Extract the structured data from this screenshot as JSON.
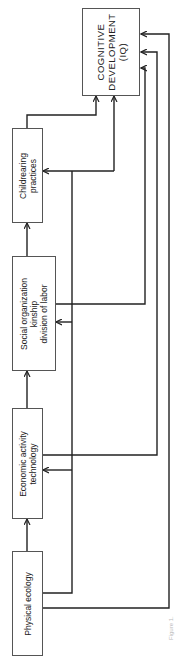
{
  "diagram": {
    "type": "flow-diagram",
    "orientation": "rotated-90-ccw",
    "nodes": [
      {
        "id": "physical_ecology",
        "lines": [
          "Physical ecology"
        ]
      },
      {
        "id": "economic_activity",
        "lines": [
          "Economic activity",
          "technology"
        ]
      },
      {
        "id": "social_organization",
        "lines": [
          "Social organization",
          "kinship",
          "division of labor"
        ]
      },
      {
        "id": "childrearing",
        "lines": [
          "Childrearing",
          "practices"
        ]
      },
      {
        "id": "cognitive_development",
        "lines": [
          "COGNITIVE",
          "DEVELOPMENT",
          "(IQ)"
        ]
      }
    ],
    "edges": [
      {
        "from": "physical_ecology",
        "to": "economic_activity"
      },
      {
        "from": "economic_activity",
        "to": "social_organization"
      },
      {
        "from": "social_organization",
        "to": "childrearing"
      },
      {
        "from": "childrearing",
        "to": "cognitive_development"
      },
      {
        "from": "physical_ecology",
        "to": "cognitive_development"
      },
      {
        "from": "economic_activity",
        "to": "cognitive_development"
      },
      {
        "from": "social_organization",
        "to": "cognitive_development"
      },
      {
        "from": "physical_ecology",
        "to": "economic_activity",
        "via": "feedback-bus"
      },
      {
        "from": "physical_ecology",
        "to": "social_organization",
        "via": "feedback-bus"
      },
      {
        "from": "physical_ecology",
        "to": "childrearing",
        "via": "feedback-bus"
      }
    ],
    "caption": "Figure 1."
  }
}
